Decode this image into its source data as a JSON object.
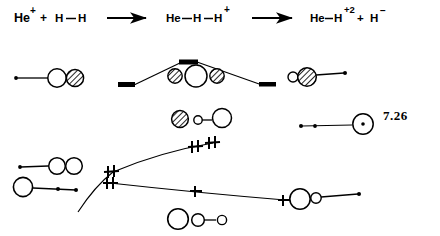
{
  "figure": {
    "label": "7.26",
    "reaction": {
      "reactants": "He⁺ + H—H",
      "arrow1": "arrow-right",
      "transition_state": "He—H—H⁺",
      "arrow2": "arrow-right",
      "products": "He—H⁺² + H⁻"
    },
    "reactants_parts": {
      "he_symbol": "He",
      "he_charge": "+",
      "plus": "+",
      "h_left": "H",
      "bond": "—",
      "h_right": "H"
    },
    "ts_parts": {
      "he_symbol": "He",
      "bond1": "—",
      "h_mid": "H",
      "bond2": "—",
      "h_right": "H",
      "charge": "+"
    },
    "products_parts": {
      "he_symbol": "He",
      "bond": "—",
      "h_symbol": "H",
      "charge": "+2",
      "plus": "+",
      "h_minus_symbol": "H",
      "h_minus_charge": "−"
    },
    "colors": {
      "ink": "#000000",
      "background": "#ffffff"
    },
    "curves": [
      {
        "name": "upper-energy-curve",
        "description": "rises to a barrier maximum then falls",
        "points": "[[131,85],[185,62],[262,85]]",
        "level_markers": [
          "left-bar",
          "peak-bar",
          "right-bar"
        ]
      },
      {
        "name": "middle-energy-curve",
        "description": "rises from lower-left to upper-right",
        "points": "[[85,200],[110,168],[215,140]]",
        "level_markers": [
          "left-cross-double",
          "mid-cross-double",
          "right-cross-double"
        ]
      },
      {
        "name": "lower-energy-curve",
        "description": "falls gently from left to right",
        "points": "[[110,182],[200,195],[280,202]]",
        "level_markers": [
          "left-cross-double",
          "mid-cross",
          "right-cross"
        ]
      }
    ],
    "orbital_diagrams": [
      {
        "name": "reactant-orbital-he-plus-h2",
        "position": "left, upper row",
        "parts": [
          "dot",
          "line",
          "open-circle",
          "hatched-circle"
        ]
      },
      {
        "name": "transition-state-orbital",
        "position": "center, upper row",
        "parts": [
          "hatched-circle",
          "open-circle-large",
          "hatched-circle"
        ]
      },
      {
        "name": "product-orbital-he-h",
        "position": "right, upper row",
        "parts": [
          "small-open-circle",
          "hatched-circle",
          "line",
          "dot"
        ]
      },
      {
        "name": "mid-orbital-hatched-small-large",
        "position": "center, middle row",
        "parts": [
          "hatched-circle",
          "small-open-circle",
          "line",
          "open-circle-large"
        ]
      },
      {
        "name": "right-orbital-dotted-circle",
        "position": "right, middle row",
        "parts": [
          "dot",
          "dot",
          "line",
          "circle-with-center-dot"
        ]
      },
      {
        "name": "lower-left-orbital-two-circles",
        "position": "left, lower row",
        "parts": [
          "dot",
          "line",
          "open-circle",
          "open-circle"
        ]
      },
      {
        "name": "lower-left-orbital-circle-line-dots",
        "position": "left, bottom row",
        "parts": [
          "open-circle-large",
          "line",
          "dot",
          "dot"
        ]
      },
      {
        "name": "bottom-center-orbital-three-circles",
        "position": "center, bottom row",
        "parts": [
          "open-circle-large",
          "open-circle-medium",
          "line",
          "small-open-circle"
        ]
      },
      {
        "name": "bottom-right-orbital-circle-small-line",
        "position": "right, bottom row",
        "parts": [
          "open-circle-large",
          "small-open-circle",
          "line",
          "dot"
        ]
      }
    ]
  }
}
